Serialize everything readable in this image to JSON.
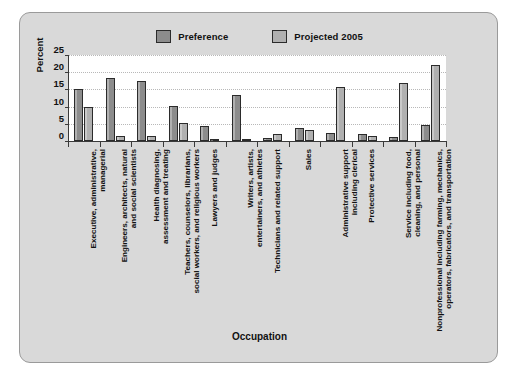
{
  "chart_data": {
    "type": "bar",
    "title": "",
    "xlabel": "Occupation",
    "ylabel": "Percent",
    "ylim": [
      0,
      25
    ],
    "yticks": [
      0,
      5,
      10,
      15,
      20,
      25
    ],
    "grid": true,
    "legend_position": "top-center",
    "categories": [
      "Executive, administrative, managerial",
      "Engineers, architects, natural and social scientists",
      "Health diagnosing, assessment and treating",
      "Teachers, counselors, librarians, social workers, and religious workers",
      "Lawyers and judges",
      "Writers, artists, entertainers, and athletes",
      "Technicians and related support",
      "Sales",
      "Administrative support including clerical",
      "Protective services",
      "Service including food, cleaning, and personal",
      "Nonprofessional including farming, mechanics, operators, fabricators, and transportation"
    ],
    "category_lines": [
      [
        "Executive, administrative,",
        "managerial"
      ],
      [
        "Engineers, architects, natural",
        "and social scientists"
      ],
      [
        "Health diagnosing,",
        "assessment and treating"
      ],
      [
        "Teachers, counselors, librarians,",
        "social workers, and religious workers"
      ],
      [
        "Lawyers and judges"
      ],
      [
        "Writers, artists,",
        "entertainers, and athletes"
      ],
      [
        "Technicians and related support"
      ],
      [
        "Sales"
      ],
      [
        "Administrative support",
        "including clerical"
      ],
      [
        "Protective services"
      ],
      [
        "Service including food,",
        "cleaning, and personal"
      ],
      [
        "Nonprofessional including farming, mechanics,",
        "operators, fabricators, and transportation"
      ]
    ],
    "series": [
      {
        "name": "Preference",
        "color": "#8c8c8c",
        "values": [
          15.0,
          18.3,
          17.5,
          10.3,
          4.3,
          13.5,
          0.8,
          3.8,
          2.2,
          2.1,
          1.3,
          4.6
        ]
      },
      {
        "name": "Projected 2005",
        "color": "#b0b0b0",
        "values": [
          9.8,
          1.6,
          1.4,
          5.3,
          0.7,
          0.6,
          2.1,
          3.3,
          15.8,
          1.5,
          16.9,
          22.0
        ]
      }
    ]
  },
  "legend": {
    "items": [
      {
        "label": "Preference",
        "color": "#8c8c8c"
      },
      {
        "label": "Projected 2005",
        "color": "#b0b0b0"
      }
    ]
  },
  "axes": {
    "y_title": "Percent",
    "x_title": "Occupation",
    "y_tick_labels": [
      "25",
      "20",
      "15",
      "10",
      "5",
      "0"
    ]
  },
  "colors": {
    "figure_background": "#d9d9d9",
    "plot_background": "#ffffff",
    "frame_border": "#9a9a9a",
    "axis": "#3a3a3a",
    "gridline": "#b8b8b8",
    "text": "#111111"
  }
}
